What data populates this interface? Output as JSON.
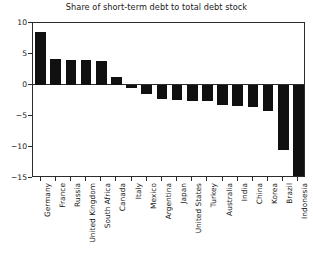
{
  "chart_data": {
    "type": "bar",
    "title": "Share of short-term debt to total debt stock",
    "xlabel": "",
    "ylabel": "",
    "ylim": [
      -15,
      10
    ],
    "yticks": [
      10,
      5,
      0,
      -5,
      -10,
      -15
    ],
    "ytick_labels": [
      "10",
      "5",
      "0",
      "−5",
      "−10",
      "−15"
    ],
    "grid": false,
    "legend": null,
    "bar_color": "#101010",
    "axis_color": "#2b2b2b",
    "background_color": "#ffffff",
    "categories": [
      "Germany",
      "France",
      "Russia",
      "United Kingdom",
      "South Africa",
      "Canada",
      "Italy",
      "Mexico",
      "Argentina",
      "Japan",
      "United States",
      "Turkey",
      "Australia",
      "India",
      "China",
      "Korea",
      "Brazil",
      "Indonesia"
    ],
    "values": [
      8.6,
      4.2,
      4.0,
      4.0,
      3.9,
      1.3,
      -0.5,
      -1.4,
      -2.3,
      -2.4,
      -2.5,
      -2.6,
      -3.2,
      -3.4,
      -3.6,
      -4.2,
      -10.5,
      -14.6
    ]
  }
}
